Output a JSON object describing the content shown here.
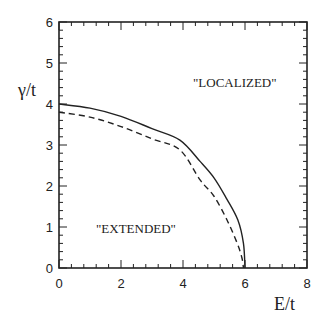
{
  "chart_data": {
    "type": "line",
    "title": "",
    "xlabel": "E/t",
    "ylabel": "γ/t",
    "xlim": [
      0,
      8
    ],
    "ylim": [
      0,
      6
    ],
    "xticks": [
      0,
      2,
      4,
      6,
      8
    ],
    "yticks": [
      0,
      1,
      2,
      3,
      4,
      5,
      6
    ],
    "grid": false,
    "legend": null,
    "annotations": [
      {
        "text": "\"LOCALIZED\"",
        "x": 5.1,
        "y": 4.5
      },
      {
        "text": "\"EXTENDED\"",
        "x": 2.1,
        "y": 0.95
      }
    ],
    "series": [
      {
        "name": "solid boundary",
        "style": "solid",
        "x": [
          0,
          1.0,
          2.0,
          3.0,
          3.9,
          4.55,
          5.0,
          5.4,
          5.77,
          5.95,
          6.0
        ],
        "y": [
          4.0,
          3.9,
          3.7,
          3.4,
          3.12,
          2.6,
          2.2,
          1.7,
          1.17,
          0.6,
          0.0
        ]
      },
      {
        "name": "dashed boundary",
        "style": "dashed",
        "x": [
          0,
          1.0,
          2.0,
          3.0,
          3.9,
          4.55,
          5.0,
          5.42,
          5.75,
          5.9,
          5.95
        ],
        "y": [
          3.8,
          3.68,
          3.45,
          3.15,
          2.88,
          2.15,
          1.75,
          1.17,
          0.6,
          0.25,
          0.0
        ]
      }
    ]
  },
  "axes": {
    "x_tick_labels": [
      "0",
      "2",
      "4",
      "6",
      "8"
    ],
    "y_tick_labels": [
      "0",
      "1",
      "2",
      "3",
      "4",
      "5",
      "6"
    ],
    "xlabel": "E/t",
    "ylabel": "γ/t"
  },
  "annotations": {
    "localized": "\"LOCALIZED\"",
    "extended": "\"EXTENDED\""
  }
}
